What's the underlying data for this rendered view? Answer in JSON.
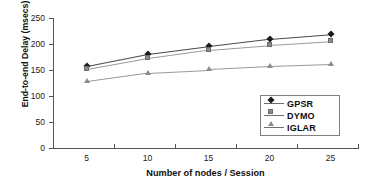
{
  "chart_data": {
    "type": "line",
    "title": "",
    "xlabel": "Number of nodes / Session",
    "ylabel": "End-to-end Delay (msecs)",
    "categories": [
      "5",
      "10",
      "15",
      "20",
      "25"
    ],
    "x": [
      5,
      10,
      15,
      20,
      25
    ],
    "xtick_labels": [
      "5",
      "10",
      "15",
      "20",
      "25"
    ],
    "ytick_labels": [
      "0",
      "50",
      "100",
      "150",
      "200",
      "250"
    ],
    "yticks": [
      0,
      50,
      100,
      150,
      200,
      250
    ],
    "ylim": [
      0,
      250
    ],
    "grid": false,
    "legend_position": "lower-right-inside",
    "series": [
      {
        "name": "GPSR",
        "marker": "diamond",
        "color": "#1a1a1a",
        "values": [
          158,
          181,
          196,
          210,
          219
        ]
      },
      {
        "name": "DYMO",
        "marker": "square",
        "color": "#8c8c8c",
        "values": [
          152,
          173,
          189,
          198,
          205
        ]
      },
      {
        "name": "IGLAR",
        "marker": "triangle",
        "color": "#8a8a8a",
        "values": [
          129,
          145,
          151,
          157,
          161
        ]
      }
    ]
  },
  "legend": {
    "entries": [
      {
        "label": "GPSR"
      },
      {
        "label": "DYMO"
      },
      {
        "label": "IGLAR"
      }
    ]
  },
  "colors": {
    "axis": "#555555",
    "text": "#101010",
    "gpsr": "#1a1a1a",
    "dymo": "#8c8c8c",
    "iglar": "#8a8a8a",
    "legend_border": "#808080",
    "background": "#ffffff"
  }
}
